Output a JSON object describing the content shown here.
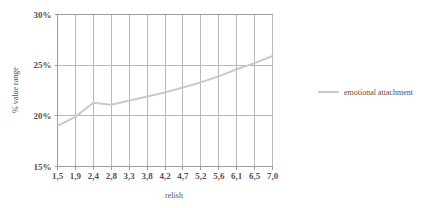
{
  "chart_data": {
    "type": "line",
    "title": "",
    "xlabel": "relish",
    "ylabel": "% value range",
    "categories": [
      "1,5",
      "1,9",
      "2,4",
      "2,8",
      "3,3",
      "3,8",
      "4,2",
      "4,7",
      "5,2",
      "5,6",
      "6,1",
      "6,5",
      "7,0"
    ],
    "x_tick_labels": [
      "1,5",
      "1,9",
      "2,4",
      "2,8",
      "3,3",
      "3,8",
      "4,2",
      "4,7",
      "5,2",
      "5,6",
      "6,1",
      "6,5",
      "7,0"
    ],
    "y_tick_labels": [
      "15%",
      "20%",
      "25%",
      "30%"
    ],
    "y_tick_values": [
      15,
      20,
      25,
      30
    ],
    "ylim": [
      15,
      30
    ],
    "grid": true,
    "grid_axis": "both",
    "legend_position": "right",
    "series": [
      {
        "name": "emotional attachment",
        "color": "#c9c9c9",
        "values": [
          19.0,
          19.9,
          21.3,
          21.1,
          21.5,
          21.9,
          22.3,
          22.8,
          23.3,
          23.9,
          24.6,
          25.2,
          25.9
        ]
      }
    ]
  },
  "legend": {
    "entries": [
      {
        "label": "emotional attachment",
        "color": "#c9c9c9"
      }
    ]
  },
  "axes": {
    "x_title": "relish",
    "y_title": "% value range"
  }
}
